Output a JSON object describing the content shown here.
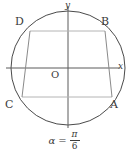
{
  "figure": {
    "type": "geometry-diagram",
    "colors": {
      "circle_stroke": "#4a4a4a",
      "axis_stroke": "#5a5a5a",
      "quad_stroke": "#8a8a8a",
      "chord_stroke": "#b0b0b0",
      "text": "#3a3a3a",
      "background": "#ffffff"
    },
    "circle": {
      "center_x": 68,
      "center_y": 68,
      "radius": 57
    },
    "axes": {
      "x_label": "x",
      "y_label": "y",
      "origin_label": "O"
    },
    "vertices": [
      {
        "label": "A",
        "x": 112,
        "y": 97
      },
      {
        "label": "B",
        "x": 105,
        "y": 31
      },
      {
        "label": "C",
        "x": 22,
        "y": 97
      },
      {
        "label": "D",
        "x": 30,
        "y": 31
      }
    ],
    "caption": {
      "variable": "α",
      "equals": "=",
      "numerator": "π",
      "denominator": "6",
      "full_text": "α = π/6"
    }
  }
}
